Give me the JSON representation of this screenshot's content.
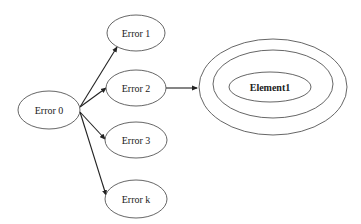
{
  "diagram": {
    "type": "graph",
    "colors": {
      "stroke": "#555555",
      "edge": "#222222",
      "background": "#ffffff",
      "text": "#222222"
    },
    "nodes": [
      {
        "id": "e0",
        "label": "Error 0",
        "cx": 51,
        "cy": 110,
        "rx": 31,
        "ry": 19
      },
      {
        "id": "e1",
        "label": "Error 1",
        "cx": 136,
        "cy": 33,
        "rx": 29,
        "ry": 18
      },
      {
        "id": "e2",
        "label": "Error 2",
        "cx": 136,
        "cy": 88,
        "rx": 30,
        "ry": 18
      },
      {
        "id": "e3",
        "label": "Error 3",
        "cx": 136,
        "cy": 140,
        "rx": 31,
        "ry": 18
      },
      {
        "id": "ek",
        "label": "Error k",
        "cx": 136,
        "cy": 199,
        "rx": 31,
        "ry": 19
      },
      {
        "id": "el1",
        "label": "Element1",
        "cx": 272,
        "cy": 87,
        "rx": 41,
        "ry": 15,
        "rings": [
          {
            "rx": 60,
            "ry": 34
          },
          {
            "rx": 74,
            "ry": 48
          }
        ]
      }
    ],
    "edges": [
      {
        "from": "e0",
        "to": "e1"
      },
      {
        "from": "e0",
        "to": "e2"
      },
      {
        "from": "e0",
        "to": "e3"
      },
      {
        "from": "e0",
        "to": "ek"
      },
      {
        "from": "e2",
        "to": "el1"
      }
    ]
  }
}
